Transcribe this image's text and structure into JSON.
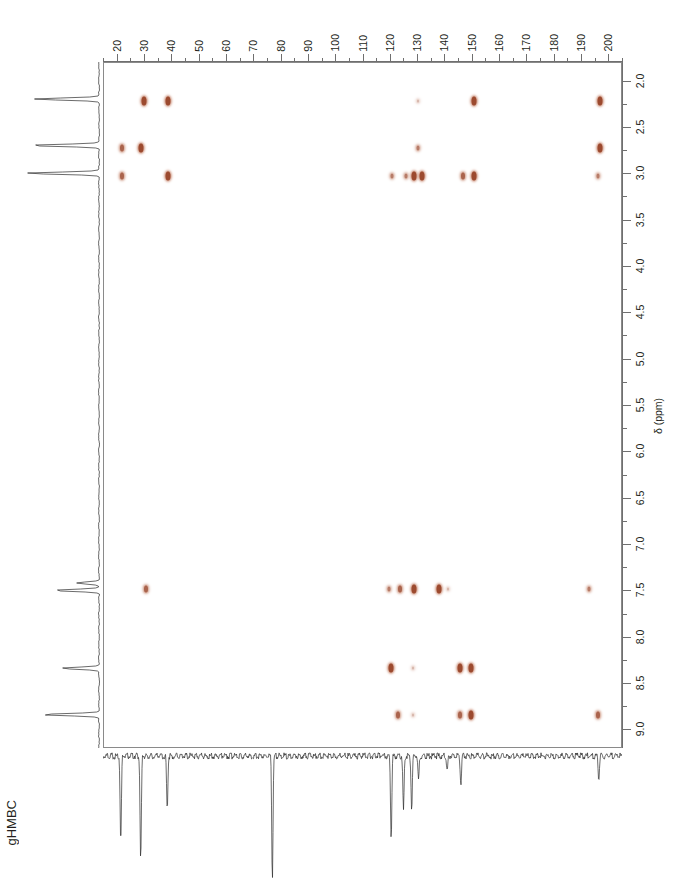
{
  "experiment": {
    "label": "gHMBC"
  },
  "axes": {
    "carbon": {
      "orientation": "top",
      "unit": "ppm",
      "min": 15,
      "max": 205,
      "major_ticks": [
        20,
        30,
        40,
        50,
        60,
        70,
        80,
        90,
        100,
        110,
        120,
        130,
        140,
        150,
        160,
        170,
        180,
        190,
        200
      ],
      "tick_labels": [
        "20",
        "30",
        "40",
        "50",
        "60",
        "70",
        "80",
        "90",
        "100",
        "110",
        "120",
        "130",
        "140",
        "150",
        "160",
        "170",
        "180",
        "190",
        "200"
      ],
      "minor_step": 5
    },
    "proton": {
      "orientation": "right",
      "unit": "ppm",
      "title": "δ (ppm)",
      "min": 1.8,
      "max": 9.2,
      "major_ticks": [
        2.0,
        2.5,
        3.0,
        3.5,
        4.0,
        4.5,
        5.0,
        5.5,
        6.0,
        6.5,
        7.0,
        7.5,
        8.0,
        8.5,
        9.0
      ],
      "tick_labels": [
        "2.0",
        "2.5",
        "3.0",
        "3.5",
        "4.0",
        "4.5",
        "5.0",
        "5.5",
        "6.0",
        "6.5",
        "7.0",
        "7.5",
        "8.0",
        "8.5",
        "9.0"
      ],
      "minor_step": 0.25
    }
  },
  "colors": {
    "peak": "#9c4a2f",
    "peak_light": "#c98a72",
    "axis": "#6f6f6f",
    "frame": "#8a8a8a",
    "trace": "#2b2b2b",
    "text": "#231f20",
    "background": "#ffffff"
  },
  "chart_data": {
    "type": "scatter",
    "title": "gHMBC",
    "xlabel": "",
    "ylabel": "δ (ppm)",
    "xlim": [
      15,
      205
    ],
    "ylim": [
      9.2,
      1.8
    ],
    "grid": false,
    "legend": "none",
    "x_axis_note": "13C chemical shift (ppm), increasing left to right, labelled on top",
    "y_axis_note": "1H chemical shift (ppm), increasing top to bottom, labelled on right",
    "cross_peaks": [
      {
        "c": 29.5,
        "h": 2.21,
        "intensity": "strong"
      },
      {
        "c": 38.5,
        "h": 2.21,
        "intensity": "strong"
      },
      {
        "c": 130.0,
        "h": 2.21,
        "intensity": "trace"
      },
      {
        "c": 150.5,
        "h": 2.21,
        "intensity": "strong"
      },
      {
        "c": 196.5,
        "h": 2.21,
        "intensity": "strong"
      },
      {
        "c": 21.5,
        "h": 2.72,
        "intensity": "medium"
      },
      {
        "c": 28.5,
        "h": 2.72,
        "intensity": "strong"
      },
      {
        "c": 130.0,
        "h": 2.72,
        "intensity": "weak"
      },
      {
        "c": 196.5,
        "h": 2.72,
        "intensity": "strong"
      },
      {
        "c": 21.5,
        "h": 3.02,
        "intensity": "medium"
      },
      {
        "c": 38.5,
        "h": 3.02,
        "intensity": "strong"
      },
      {
        "c": 120.5,
        "h": 3.02,
        "intensity": "weak"
      },
      {
        "c": 125.5,
        "h": 3.02,
        "intensity": "weak"
      },
      {
        "c": 128.5,
        "h": 3.02,
        "intensity": "strong"
      },
      {
        "c": 131.5,
        "h": 3.02,
        "intensity": "strong"
      },
      {
        "c": 146.5,
        "h": 3.02,
        "intensity": "medium"
      },
      {
        "c": 150.5,
        "h": 3.02,
        "intensity": "strong"
      },
      {
        "c": 196.0,
        "h": 3.02,
        "intensity": "weak"
      },
      {
        "c": 30.5,
        "h": 7.47,
        "intensity": "medium"
      },
      {
        "c": 119.5,
        "h": 7.47,
        "intensity": "weak"
      },
      {
        "c": 123.5,
        "h": 7.47,
        "intensity": "medium"
      },
      {
        "c": 128.5,
        "h": 7.47,
        "intensity": "strong"
      },
      {
        "c": 137.5,
        "h": 7.47,
        "intensity": "strong"
      },
      {
        "c": 141.0,
        "h": 7.47,
        "intensity": "trace"
      },
      {
        "c": 192.5,
        "h": 7.47,
        "intensity": "weak"
      },
      {
        "c": 120.0,
        "h": 8.33,
        "intensity": "strong"
      },
      {
        "c": 128.0,
        "h": 8.33,
        "intensity": "trace"
      },
      {
        "c": 145.5,
        "h": 8.33,
        "intensity": "strong"
      },
      {
        "c": 149.5,
        "h": 8.33,
        "intensity": "strong"
      },
      {
        "c": 122.5,
        "h": 8.83,
        "intensity": "medium"
      },
      {
        "c": 128.0,
        "h": 8.83,
        "intensity": "trace"
      },
      {
        "c": 145.5,
        "h": 8.83,
        "intensity": "medium"
      },
      {
        "c": 149.5,
        "h": 8.83,
        "intensity": "strong"
      },
      {
        "c": 196.0,
        "h": 8.83,
        "intensity": "medium"
      }
    ],
    "proton_projection_peaks": [
      {
        "shift": 2.2,
        "height": 0.88
      },
      {
        "shift": 2.7,
        "height": 0.95
      },
      {
        "shift": 3.0,
        "height": 1.0
      },
      {
        "shift": 7.42,
        "height": 0.3
      },
      {
        "shift": 7.5,
        "height": 0.62
      },
      {
        "shift": 8.34,
        "height": 0.52
      },
      {
        "shift": 8.84,
        "height": 0.78
      }
    ],
    "carbon_projection_peaks": [
      {
        "shift": 21.5,
        "height": 0.72
      },
      {
        "shift": 28.8,
        "height": 0.86
      },
      {
        "shift": 38.5,
        "height": 0.44
      },
      {
        "shift": 77.0,
        "height": 1.0
      },
      {
        "shift": 120.5,
        "height": 0.68
      },
      {
        "shift": 125.0,
        "height": 0.45
      },
      {
        "shift": 128.0,
        "height": 0.43
      },
      {
        "shift": 130.5,
        "height": 0.2
      },
      {
        "shift": 141.0,
        "height": 0.12
      },
      {
        "shift": 146.0,
        "height": 0.22
      },
      {
        "shift": 196.5,
        "height": 0.18
      }
    ]
  }
}
